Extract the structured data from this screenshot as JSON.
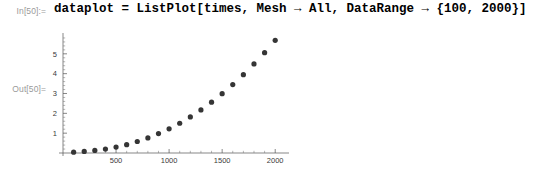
{
  "notebook": {
    "in_label": "In[50]:=",
    "out_label": "Out[50]=",
    "input_code": "dataplot = ListPlot[times, Mesh → All, DataRange → {100, 2000}]"
  },
  "chart_data": {
    "type": "scatter",
    "title": "",
    "xlabel": "",
    "ylabel": "",
    "xlim": [
      0,
      2130
    ],
    "ylim": [
      0,
      6.05
    ],
    "grid": false,
    "legend": null,
    "xticks": [
      500,
      1000,
      1500,
      2000
    ],
    "xtick_labels": [
      "500",
      "1000",
      "1500",
      "2000"
    ],
    "yticks": [
      1,
      2,
      3,
      4,
      5
    ],
    "ytick_labels": [
      "1",
      "2",
      "3",
      "4",
      "5"
    ],
    "marker": "point",
    "marker_color": "#353535",
    "marker_size": 2.6,
    "x": [
      100,
      200,
      300,
      400,
      500,
      600,
      700,
      800,
      900,
      1000,
      1100,
      1200,
      1300,
      1400,
      1500,
      1600,
      1700,
      1800,
      1900,
      2000
    ],
    "y": [
      0.04,
      0.08,
      0.13,
      0.2,
      0.3,
      0.42,
      0.58,
      0.76,
      0.98,
      1.22,
      1.5,
      1.82,
      2.17,
      2.56,
      2.99,
      3.45,
      3.95,
      4.49,
      5.06,
      5.68
    ]
  }
}
